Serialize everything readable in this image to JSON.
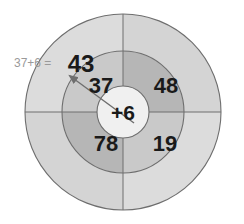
{
  "diagram": {
    "type": "concentric-target-wheel",
    "title_annotation": "37+6 =",
    "center_label": "+6",
    "outer_result": "43",
    "inner_numbers": {
      "top_left": "37",
      "top_right": "48",
      "bottom_left": "78",
      "bottom_right": "19"
    },
    "arrow": {
      "from": "center",
      "to": "outer-ring-upper-left",
      "points_to_value": "43"
    }
  },
  "colors": {
    "background": "#ffffff",
    "outer_ring_light": "#dcdcdc",
    "outer_ring_dark": "#d2d2d2",
    "inner_ring_light": "#c8c8c8",
    "inner_ring_dark": "#b4b4b4",
    "center_fill": "#f0f0f0",
    "stroke": "#6e6e6e",
    "number_text": "#1a1a1a",
    "annotation_text": "#9a9a9a"
  }
}
